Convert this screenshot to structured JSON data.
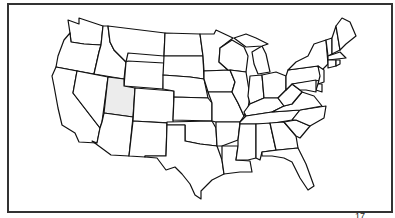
{
  "map": {
    "title": "United States map",
    "highlighted_state": "Utah",
    "highlight_color": "#ececec",
    "border_color": "#333333",
    "states": [
      "WA",
      "OR",
      "CA",
      "ID",
      "NV",
      "MT",
      "WY",
      "UT",
      "AZ",
      "CO",
      "NM",
      "ND",
      "SD",
      "NE",
      "KS",
      "OK",
      "TX",
      "MN",
      "IA",
      "MO",
      "AR",
      "LA",
      "WI",
      "IL",
      "MI",
      "IN",
      "OH",
      "KY",
      "TN",
      "MS",
      "AL",
      "GA",
      "FL",
      "SC",
      "NC",
      "VA",
      "WV",
      "PA",
      "NY",
      "VT",
      "NH",
      "ME",
      "MA",
      "CT",
      "RI",
      "NJ",
      "DE",
      "MD"
    ]
  },
  "footer": {
    "partial_text": "17"
  }
}
